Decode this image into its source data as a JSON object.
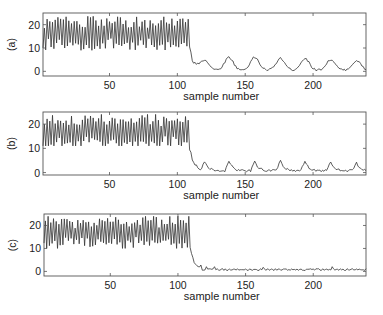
{
  "chart_data": [
    {
      "type": "line",
      "panel_label": "(a)",
      "xlabel": "sample number",
      "ylabel": "",
      "xlim": [
        1,
        239
      ],
      "ylim": [
        -2,
        25
      ],
      "xticks": [
        50,
        100,
        150,
        200
      ],
      "yticks": [
        0,
        10,
        20
      ],
      "grid": false,
      "line_color": "#333333",
      "description": "Noisy oscillation ~10-24 for samples 1-108, sharp drop to ~0-1 near sample 112, then periodic peaks ~5-6 at samples ~120,138,157,176,194,213,232",
      "peaks": [
        {
          "x": 120,
          "y": 5
        },
        {
          "x": 138,
          "y": 6
        },
        {
          "x": 157,
          "y": 6
        },
        {
          "x": 176,
          "y": 5.5
        },
        {
          "x": 194,
          "y": 5.5
        },
        {
          "x": 213,
          "y": 5
        },
        {
          "x": 232,
          "y": 4.5
        }
      ],
      "segment_1": {
        "x_range": [
          1,
          108
        ],
        "y_range": [
          9,
          24
        ],
        "mean": 16
      },
      "segment_2": {
        "x_range": [
          112,
          239
        ],
        "baseline": 0.5
      }
    },
    {
      "type": "line",
      "panel_label": "(b)",
      "xlabel": "sample number",
      "ylabel": "",
      "xlim": [
        1,
        239
      ],
      "ylim": [
        -1,
        25
      ],
      "xticks": [
        50,
        100,
        150,
        200
      ],
      "yticks": [
        0,
        10,
        20
      ],
      "grid": false,
      "line_color": "#333333",
      "description": "Noisy oscillation ~11-24 for samples 1-108, sharp drop near sample 112, then sawtooth peaks ~4-5 at samples ~120,138,157,176,194,213,232",
      "peaks": [
        {
          "x": 120,
          "y": 4.5
        },
        {
          "x": 138,
          "y": 5
        },
        {
          "x": 157,
          "y": 5
        },
        {
          "x": 176,
          "y": 5
        },
        {
          "x": 194,
          "y": 5
        },
        {
          "x": 213,
          "y": 4.5
        },
        {
          "x": 232,
          "y": 4
        }
      ],
      "segment_1": {
        "x_range": [
          1,
          108
        ],
        "y_range": [
          11,
          24
        ],
        "mean": 17
      },
      "segment_2": {
        "x_range": [
          112,
          239
        ],
        "baseline": 0.8
      }
    },
    {
      "type": "line",
      "panel_label": "(c)",
      "xlabel": "sample number",
      "ylabel": "",
      "xlim": [
        1,
        239
      ],
      "ylim": [
        -2,
        25
      ],
      "xticks": [
        50,
        100,
        150,
        200
      ],
      "yticks": [
        0,
        10,
        20
      ],
      "grid": false,
      "line_color": "#333333",
      "description": "Noisy oscillation ~10-24 for samples 1-108, sharp drop near sample 112, then nearly flat ~0-2 with small bumps",
      "segment_1": {
        "x_range": [
          1,
          108
        ],
        "y_range": [
          10,
          24
        ],
        "mean": 17
      },
      "segment_2": {
        "x_range": [
          112,
          239
        ],
        "baseline": 0.8,
        "noise": 0.8
      }
    }
  ],
  "panels": [
    {
      "label": "(a)",
      "xlabel": "sample number",
      "xtick_labels": [
        "50",
        "100",
        "150",
        "200"
      ],
      "ytick_labels": [
        "0",
        "10",
        "20"
      ]
    },
    {
      "label": "(b)",
      "xlabel": "sample number",
      "xtick_labels": [
        "50",
        "100",
        "150",
        "200"
      ],
      "ytick_labels": [
        "0",
        "10",
        "20"
      ]
    },
    {
      "label": "(c)",
      "xlabel": "sample number",
      "xtick_labels": [
        "50",
        "100",
        "150",
        "200"
      ],
      "ytick_labels": [
        "0",
        "10",
        "20"
      ]
    }
  ]
}
